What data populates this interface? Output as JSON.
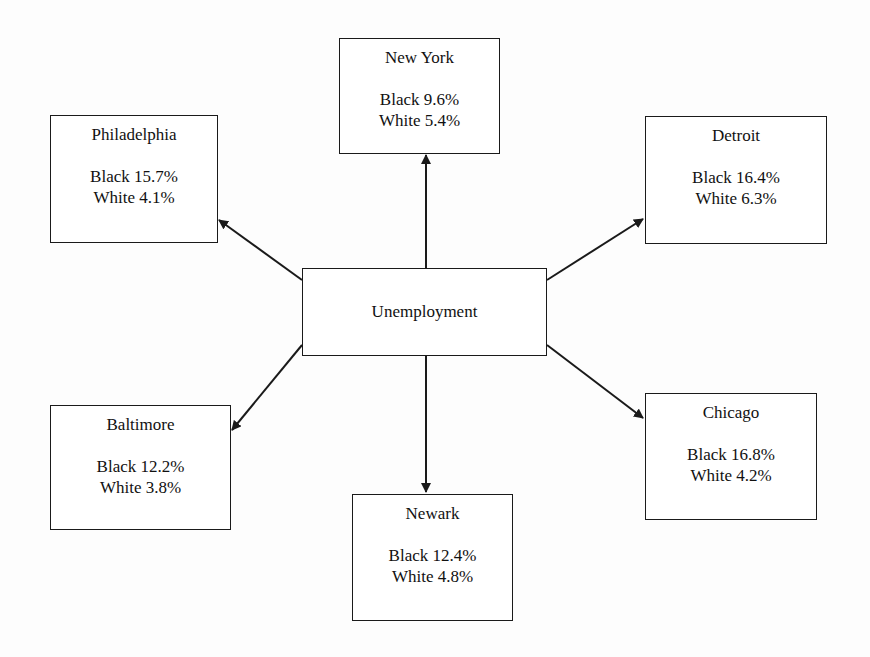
{
  "diagram": {
    "center": {
      "label": "Unemployment"
    },
    "nodes": [
      {
        "city": "New York",
        "black_label": "Black 9.6%",
        "white_label": "White 5.4%",
        "black_rate": 9.6,
        "white_rate": 5.4
      },
      {
        "city": "Philadelphia",
        "black_label": "Black 15.7%",
        "white_label": "White 4.1%",
        "black_rate": 15.7,
        "white_rate": 4.1
      },
      {
        "city": "Detroit",
        "black_label": "Black 16.4%",
        "white_label": "White 6.3%",
        "black_rate": 16.4,
        "white_rate": 6.3
      },
      {
        "city": "Baltimore",
        "black_label": "Black 12.2%",
        "white_label": "White 3.8%",
        "black_rate": 12.2,
        "white_rate": 3.8
      },
      {
        "city": "Chicago",
        "black_label": "Black 16.8%",
        "white_label": "White 4.2%",
        "black_rate": 16.8,
        "white_rate": 4.2
      },
      {
        "city": "Newark",
        "black_label": "Black 12.4%",
        "white_label": "White 4.8%",
        "black_rate": 12.4,
        "white_rate": 4.8
      }
    ],
    "edges": [
      {
        "from": "Unemployment",
        "to": "New York"
      },
      {
        "from": "Unemployment",
        "to": "Philadelphia"
      },
      {
        "from": "Unemployment",
        "to": "Detroit"
      },
      {
        "from": "Unemployment",
        "to": "Baltimore"
      },
      {
        "from": "Unemployment",
        "to": "Chicago"
      },
      {
        "from": "Unemployment",
        "to": "Newark"
      }
    ],
    "colors": {
      "line": "#1a1a1a",
      "background": "#ffffff"
    }
  }
}
